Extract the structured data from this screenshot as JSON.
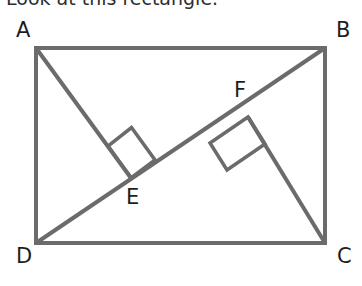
{
  "heading": {
    "text": "Look at this rectangle."
  },
  "figure": {
    "type": "geometry-diagram",
    "stroke_color": "#6b6b6b",
    "label_color": "#1d1d1d",
    "background_color": "#ffffff",
    "stroke_width": 4,
    "rectangle": {
      "name": "ABCD",
      "corners": [
        {
          "label": "A",
          "x": 36,
          "y": 48
        },
        {
          "label": "B",
          "x": 325,
          "y": 48
        },
        {
          "label": "C",
          "x": 325,
          "y": 243
        },
        {
          "label": "D",
          "x": 36,
          "y": 243
        }
      ]
    },
    "diagonal": {
      "from": "D",
      "to": "B",
      "x1": 36,
      "y1": 243,
      "x2": 325,
      "y2": 48
    },
    "perpendiculars": [
      {
        "label": "E",
        "from": "A",
        "foot_x": 131,
        "foot_y": 178,
        "x1": 36,
        "y1": 48,
        "right_angle_marker": true
      },
      {
        "label": "F",
        "from": "C",
        "foot_x": 248,
        "foot_y": 117,
        "x1": 325,
        "y1": 243,
        "right_angle_marker": true
      }
    ],
    "labels": {
      "A": "A",
      "B": "B",
      "C": "C",
      "D": "D",
      "E": "E",
      "F": "F"
    }
  }
}
